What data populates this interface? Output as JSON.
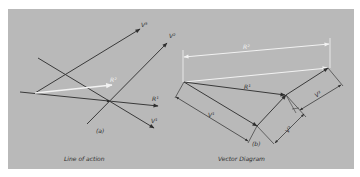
{
  "figure": {
    "background_color": "#b9b9b9",
    "line_color": "#3a3a3a",
    "highlight_color": "#f2f2f2"
  },
  "panel_a": {
    "tag": "(a)",
    "caption": "Line of action",
    "labels": {
      "v1": "V¹",
      "v2": "V²",
      "v3": "V³",
      "r1": "R¹",
      "r2": "R²"
    }
  },
  "panel_b": {
    "tag": "(b)",
    "caption": "Vector Diagram",
    "labels": {
      "v1": "V¹",
      "v2": "V²",
      "v3": "V³",
      "r1": "R¹",
      "r2": "R²"
    }
  }
}
